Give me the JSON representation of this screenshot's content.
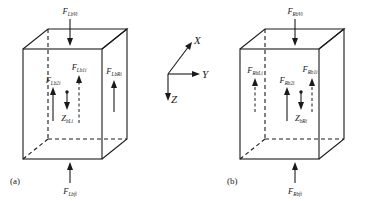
{
  "figure": {
    "background": "#ffffff",
    "line_color": "#1a1a1a",
    "panels": [
      {
        "id": "a",
        "caption": "(a)",
        "labels": {
          "top": {
            "base": "F",
            "sub": "LbVi"
          },
          "inner_mid": {
            "base": "F",
            "sub": "Lb1i"
          },
          "inner_left": {
            "base": "F",
            "sub": "Lb2i"
          },
          "inner_right": {
            "base": "F",
            "sub": "LbRi"
          },
          "z": {
            "base": "Z",
            "sub": "bLi"
          },
          "bottom": {
            "base": "F",
            "sub": "Lbfi"
          }
        }
      },
      {
        "id": "b",
        "caption": "(b)",
        "labels": {
          "top": {
            "base": "F",
            "sub": "RbVi"
          },
          "inner_mid": {
            "base": "F",
            "sub": "Rb2i"
          },
          "inner_left": {
            "base": "F",
            "sub": "RbLi"
          },
          "inner_right": {
            "base": "F",
            "sub": "Rb1i"
          },
          "z": {
            "base": "Z",
            "sub": "bRi"
          },
          "bottom": {
            "base": "F",
            "sub": "Rbfi"
          }
        }
      }
    ],
    "axes": {
      "x": "X",
      "y": "Y",
      "z": "Z"
    }
  }
}
